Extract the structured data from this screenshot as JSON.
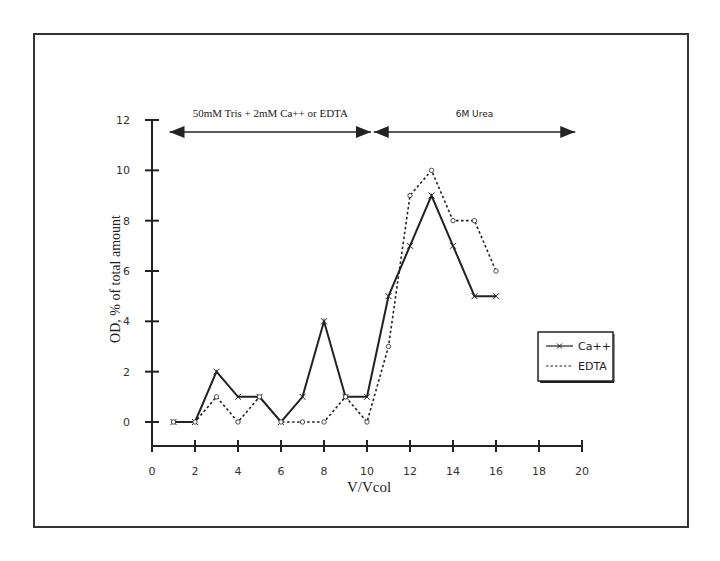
{
  "chart_data": {
    "type": "line",
    "title": "",
    "xlabel": "V/Vcol",
    "ylabel": "OD, % of total amount",
    "xlim": [
      0,
      20
    ],
    "ylim": [
      0,
      12
    ],
    "xticks": [
      0,
      2,
      4,
      6,
      8,
      10,
      12,
      14,
      16,
      18,
      20
    ],
    "yticks": [
      0,
      2,
      4,
      6,
      8,
      10,
      12
    ],
    "grid": false,
    "legend_position": "right-middle",
    "x": [
      1,
      2,
      3,
      4,
      5,
      6,
      7,
      8,
      9,
      10,
      11,
      12,
      13,
      14,
      15,
      16
    ],
    "series": [
      {
        "name": "Ca++",
        "style": "solid",
        "marker": "x",
        "values": [
          0,
          0,
          2,
          1,
          1,
          0,
          1,
          4,
          1,
          1,
          5,
          7,
          9,
          7,
          5,
          5
        ]
      },
      {
        "name": "EDTA",
        "style": "dashed",
        "marker": "o",
        "values": [
          0,
          0,
          1,
          0,
          1,
          0,
          0,
          0,
          1,
          0,
          3,
          9,
          10,
          8,
          8,
          6
        ]
      }
    ],
    "annotations": [
      {
        "text": "50mM Tris + 2mM Ca++ or EDTA",
        "type": "double-arrow",
        "x_range": [
          1,
          10
        ],
        "y": 11.6
      },
      {
        "text": "6M Urea",
        "type": "double-arrow",
        "x_range": [
          10.5,
          19.5
        ],
        "y": 11.6
      }
    ]
  },
  "legend": {
    "items": [
      {
        "label": "Ca++"
      },
      {
        "label": "EDTA"
      }
    ]
  },
  "colors": {
    "line": "#222222",
    "axis": "#222222",
    "frame": "#333333"
  }
}
